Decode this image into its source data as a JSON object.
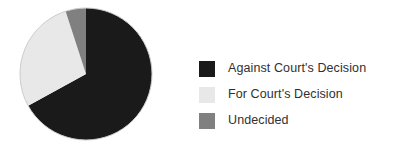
{
  "chart_data": {
    "type": "pie",
    "title": "",
    "subtitle": "",
    "xlabel": "",
    "ylabel": "",
    "grid": false,
    "legend_position": "right",
    "start_angle_deg": 0,
    "direction": "clockwise",
    "center": {
      "cx": 68,
      "cy": 68,
      "r": 66
    },
    "categories": [
      "Against Court's Decision",
      "For Court's Decision",
      "Undecided"
    ],
    "values": [
      67,
      28,
      5
    ],
    "unit": "percent",
    "slices": [
      {
        "label": "Against Court's Decision",
        "value": 67,
        "color": "#1a1a1a",
        "start_deg": 0,
        "end_deg": 241.2
      },
      {
        "label": "For Court's Decision",
        "value": 28,
        "color": "#e8e8e8",
        "start_deg": 241.2,
        "end_deg": 342.0
      },
      {
        "label": "Undecided",
        "value": 5,
        "color": "#808080",
        "start_deg": 342.0,
        "end_deg": 360.0
      }
    ]
  },
  "legend": {
    "items": [
      {
        "label": "Against Court's Decision",
        "color": "#1a1a1a",
        "swatch_name": "legend-swatch-against"
      },
      {
        "label": "For Court's Decision",
        "color": "#e8e8e8",
        "swatch_name": "legend-swatch-for"
      },
      {
        "label": "Undecided",
        "color": "#808080",
        "swatch_name": "legend-swatch-undecided"
      }
    ]
  },
  "colors": {
    "background": "#ffffff",
    "text": "#303030",
    "against": "#1a1a1a",
    "for": "#e8e8e8",
    "undecided": "#808080",
    "pie_outline": "#cccccc"
  }
}
